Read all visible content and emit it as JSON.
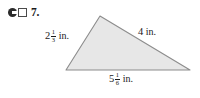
{
  "problem": {
    "number": "7.",
    "icons": {
      "disc": "pencil-icon",
      "square": "notebook-icon"
    }
  },
  "figure": {
    "shape": "triangle",
    "fill_color": "#e7e7e7",
    "stroke_color": "#8c8c8c",
    "vertices": {
      "apex": {
        "x": 100,
        "y": 16
      },
      "bottom_left": {
        "x": 66,
        "y": 70
      },
      "bottom_right": {
        "x": 190,
        "y": 70
      }
    },
    "labels": {
      "left_side": {
        "whole": "2",
        "numerator": "1",
        "denominator": "3",
        "unit": "in."
      },
      "right_side": {
        "whole": "4",
        "numerator": "",
        "denominator": "",
        "unit": "in."
      },
      "base": {
        "whole": "5",
        "numerator": "1",
        "denominator": "6",
        "unit": "in."
      }
    }
  }
}
